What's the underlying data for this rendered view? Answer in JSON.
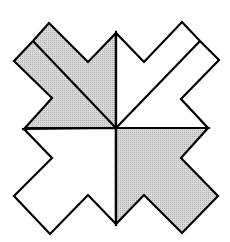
{
  "figure": {
    "colors": {
      "background": "#ffffff",
      "stroke": "#000000",
      "shaded_fill": "#cfcfcf",
      "unshaded_fill": "#ffffff"
    },
    "stroke_width": 2.2,
    "pieces": [
      {
        "name": "top-left-quadrant",
        "shaded": true,
        "points": "116,128 24,129 52,98 14,61 33,41 49,23 88,62 116,33"
      },
      {
        "name": "top-right-quadrant",
        "shaded": false,
        "points": "116,128 116,33 144,62 182,22 200,41 219,60 181,99 208,128"
      },
      {
        "name": "bottom-left-quadrant",
        "shaded": false,
        "points": "116,128 24,129 52,158 14,196 50,234 88,195 116,224"
      },
      {
        "name": "bottom-right-quadrant",
        "shaded": true,
        "points": "116,128 208,128 181,158 218,196 182,233 144,195 116,224"
      }
    ],
    "internal_lines": [
      {
        "name": "top-left-diagonal",
        "x1": 33,
        "y1": 41,
        "x2": 116,
        "y2": 128
      },
      {
        "name": "top-right-diagonal",
        "x1": 200,
        "y1": 41,
        "x2": 116,
        "y2": 128
      },
      {
        "name": "vertical-divider",
        "x1": 116,
        "y1": 33,
        "x2": 116,
        "y2": 224
      },
      {
        "name": "horizontal-divider",
        "x1": 24,
        "y1": 128,
        "x2": 208,
        "y2": 128
      }
    ]
  }
}
